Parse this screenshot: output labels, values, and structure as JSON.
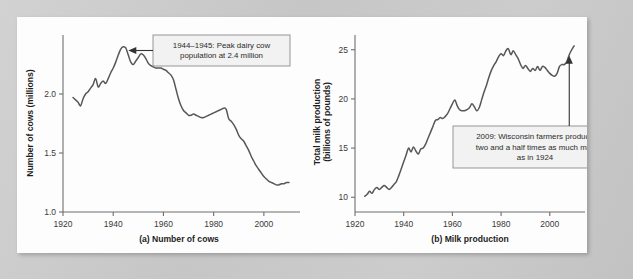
{
  "figure": {
    "background_color": "#c9c9c9",
    "panel_color": "#fdfdfd",
    "series_color": "#575757",
    "callout_fill": "#f2f2f2",
    "callout_stroke": "#8c8c8c"
  },
  "chart_data": [
    {
      "id": "a",
      "type": "line",
      "title": "",
      "caption": "(a) Number of cows",
      "xlabel": "",
      "ylabel": "Number of cows (millions)",
      "xlim": [
        1920,
        2012
      ],
      "ylim": [
        1.0,
        2.5
      ],
      "grid": false,
      "legend": "none",
      "xticks": [
        1920,
        1940,
        1960,
        1980,
        2000
      ],
      "xticklabels": [
        "1920",
        "1940",
        "1960",
        "1980",
        "2000"
      ],
      "yticks": [
        1.0,
        1.5,
        2.0
      ],
      "yticklabels": [
        "1.0",
        "1.5",
        "2.0"
      ],
      "x": [
        1924,
        1925,
        1926,
        1927,
        1928,
        1929,
        1930,
        1931,
        1932,
        1933,
        1934,
        1935,
        1936,
        1937,
        1938,
        1939,
        1940,
        1941,
        1942,
        1943,
        1944,
        1945,
        1946,
        1947,
        1948,
        1949,
        1950,
        1951,
        1952,
        1953,
        1954,
        1955,
        1956,
        1957,
        1958,
        1959,
        1960,
        1961,
        1962,
        1963,
        1964,
        1965,
        1966,
        1967,
        1968,
        1969,
        1970,
        1971,
        1972,
        1973,
        1974,
        1975,
        1976,
        1977,
        1978,
        1979,
        1980,
        1981,
        1982,
        1983,
        1984,
        1985,
        1986,
        1987,
        1988,
        1989,
        1990,
        1991,
        1992,
        1993,
        1994,
        1995,
        1996,
        1997,
        1998,
        1999,
        2000,
        2001,
        2002,
        2003,
        2004,
        2005,
        2006,
        2007,
        2008,
        2009,
        2010
      ],
      "y": [
        1.97,
        1.95,
        1.93,
        1.9,
        1.96,
        2.0,
        2.02,
        2.05,
        2.08,
        2.13,
        2.06,
        2.09,
        2.11,
        2.09,
        2.13,
        2.18,
        2.22,
        2.27,
        2.33,
        2.38,
        2.4,
        2.39,
        2.33,
        2.27,
        2.25,
        2.28,
        2.31,
        2.34,
        2.33,
        2.3,
        2.26,
        2.24,
        2.23,
        2.22,
        2.22,
        2.22,
        2.21,
        2.2,
        2.18,
        2.16,
        2.12,
        2.04,
        1.96,
        1.9,
        1.86,
        1.84,
        1.82,
        1.82,
        1.83,
        1.82,
        1.81,
        1.8,
        1.8,
        1.81,
        1.82,
        1.83,
        1.84,
        1.85,
        1.86,
        1.87,
        1.88,
        1.87,
        1.79,
        1.77,
        1.74,
        1.7,
        1.65,
        1.62,
        1.6,
        1.56,
        1.52,
        1.47,
        1.43,
        1.39,
        1.36,
        1.33,
        1.3,
        1.28,
        1.26,
        1.25,
        1.24,
        1.23,
        1.23,
        1.24,
        1.24,
        1.25,
        1.25
      ],
      "annotations": [
        {
          "name": "peak-cows-callout",
          "lines": [
            "1944–1945: Peak dairy cow",
            "population at 2.4 million"
          ],
          "points_at_year": 1946,
          "points_at_value": 2.33,
          "arrow": "left"
        }
      ]
    },
    {
      "id": "b",
      "type": "line",
      "title": "",
      "caption": "(b) Milk production",
      "xlabel": "",
      "ylabel": "Total milk production\n(billions of pounds)",
      "ylabel_line1": "Total milk production",
      "ylabel_line2": "(billions of pounds)",
      "xlim": [
        1920,
        2012
      ],
      "ylim": [
        8.5,
        26.5
      ],
      "grid": false,
      "legend": "none",
      "xticks": [
        1920,
        1940,
        1960,
        1980,
        2000
      ],
      "xticklabels": [
        "1920",
        "1940",
        "1960",
        "1980",
        "2000"
      ],
      "yticks": [
        10,
        15,
        20,
        25
      ],
      "yticklabels": [
        "10",
        "15",
        "20",
        "25"
      ],
      "x": [
        1924,
        1925,
        1926,
        1927,
        1928,
        1929,
        1930,
        1931,
        1932,
        1933,
        1934,
        1935,
        1936,
        1937,
        1938,
        1939,
        1940,
        1941,
        1942,
        1943,
        1944,
        1945,
        1946,
        1947,
        1948,
        1949,
        1950,
        1951,
        1952,
        1953,
        1954,
        1955,
        1956,
        1957,
        1958,
        1959,
        1960,
        1961,
        1962,
        1963,
        1964,
        1965,
        1966,
        1967,
        1968,
        1969,
        1970,
        1971,
        1972,
        1973,
        1974,
        1975,
        1976,
        1977,
        1978,
        1979,
        1980,
        1981,
        1982,
        1983,
        1984,
        1985,
        1986,
        1987,
        1988,
        1989,
        1990,
        1991,
        1992,
        1993,
        1994,
        1995,
        1996,
        1997,
        1998,
        1999,
        2000,
        2001,
        2002,
        2003,
        2004,
        2005,
        2006,
        2007,
        2008,
        2009,
        2010
      ],
      "y": [
        10.1,
        10.3,
        10.6,
        10.4,
        10.8,
        11.0,
        10.8,
        11.0,
        11.2,
        11.0,
        10.8,
        11.0,
        11.3,
        11.6,
        12.2,
        12.9,
        13.6,
        14.3,
        15.0,
        14.6,
        15.1,
        14.7,
        14.4,
        14.9,
        15.0,
        15.4,
        16.0,
        16.6,
        17.2,
        17.8,
        17.9,
        18.1,
        18.0,
        18.2,
        18.5,
        19.0,
        19.5,
        19.9,
        19.3,
        18.9,
        18.8,
        18.8,
        18.9,
        19.1,
        19.5,
        19.2,
        18.8,
        19.1,
        19.9,
        20.7,
        21.4,
        22.2,
        22.9,
        23.4,
        23.8,
        24.3,
        24.6,
        24.4,
        24.9,
        25.1,
        24.5,
        24.9,
        24.5,
        24.1,
        23.5,
        23.1,
        23.4,
        23.1,
        22.8,
        23.1,
        22.9,
        23.3,
        22.9,
        23.3,
        23.2,
        22.9,
        22.6,
        22.4,
        22.3,
        22.6,
        23.3,
        23.5,
        23.5,
        23.8,
        24.5,
        25.0,
        25.4
      ],
      "annotations": [
        {
          "name": "milk-2009-callout",
          "lines": [
            "2009: Wisconsin farmers produce",
            "two and a half times as much milk",
            "as in 1924"
          ],
          "points_at_year": 2008,
          "points_at_value": 24.4,
          "arrow": "up"
        }
      ]
    }
  ]
}
